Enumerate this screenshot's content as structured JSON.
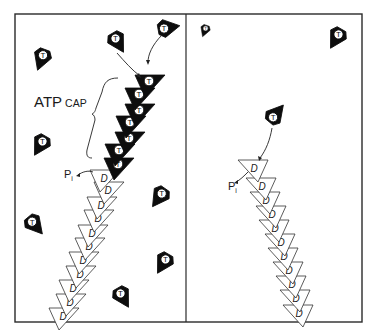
{
  "figure": {
    "colors": {
      "t_subunit": "#0d0d0d",
      "d_subunit": "#ffffff",
      "hydrolyzing": "#c9c9c9",
      "line": "#2a2a2a"
    },
    "frame": {
      "left": 15,
      "top": 14,
      "right": 362,
      "bottom": 322,
      "divider_x": 186
    }
  },
  "labels": {
    "atp": "ATP",
    "cap": "CAP",
    "pi_left_main": "P",
    "pi_left_sub": "i",
    "pi_right_main": "P",
    "pi_right_sub": "i",
    "nucleotide_t": "T",
    "nucleotide_d": "D"
  },
  "left_panel": {
    "title": "Growing end with ATP cap",
    "free_t_subunits": [
      {
        "x": 42,
        "y": 58,
        "rot": 200
      },
      {
        "x": 117,
        "y": 41,
        "rot": 150
      },
      {
        "x": 167,
        "y": 28,
        "rot": 80
      },
      {
        "x": 41,
        "y": 144,
        "rot": 210
      },
      {
        "x": 34,
        "y": 224,
        "rot": 140
      },
      {
        "x": 160,
        "y": 196,
        "rot": 215
      },
      {
        "x": 164,
        "y": 262,
        "rot": 210
      },
      {
        "x": 122,
        "y": 296,
        "rot": 150
      }
    ],
    "cap_t_subunits": [
      {
        "x": 145,
        "y": 83
      },
      {
        "x": 135,
        "y": 96
      },
      {
        "x": 135,
        "y": 112
      },
      {
        "x": 126,
        "y": 124
      },
      {
        "x": 125,
        "y": 140
      },
      {
        "x": 115,
        "y": 152
      },
      {
        "x": 114,
        "y": 166
      }
    ],
    "hydrolyzing_subunit": {
      "x": 100,
      "y": 178
    },
    "d_subunits": [
      {
        "x": 104,
        "y": 190
      },
      {
        "x": 97,
        "y": 205
      },
      {
        "x": 94,
        "y": 218
      },
      {
        "x": 88,
        "y": 233
      },
      {
        "x": 85,
        "y": 246
      },
      {
        "x": 79,
        "y": 260
      },
      {
        "x": 76,
        "y": 274
      },
      {
        "x": 69,
        "y": 288
      },
      {
        "x": 66,
        "y": 302
      },
      {
        "x": 59,
        "y": 316
      }
    ]
  },
  "right_panel": {
    "title": "Capless end with D-subunits",
    "free_t_subunits": [
      {
        "x": 205,
        "y": 30,
        "rot": 200,
        "scale": 0.55
      },
      {
        "x": 337,
        "y": 37,
        "rot": 210,
        "scale": 1
      },
      {
        "x": 275,
        "y": 115,
        "rot": 40,
        "scale": 1
      }
    ],
    "hydrolyzing_subunit": {
      "x": 258,
      "y": 168
    },
    "d_subunits": [
      {
        "x": 266,
        "y": 186
      },
      {
        "x": 270,
        "y": 200
      },
      {
        "x": 276,
        "y": 214
      },
      {
        "x": 279,
        "y": 228
      },
      {
        "x": 285,
        "y": 242
      },
      {
        "x": 288,
        "y": 256
      },
      {
        "x": 293,
        "y": 270
      },
      {
        "x": 296,
        "y": 284
      },
      {
        "x": 300,
        "y": 298
      },
      {
        "x": 303,
        "y": 313
      }
    ]
  }
}
